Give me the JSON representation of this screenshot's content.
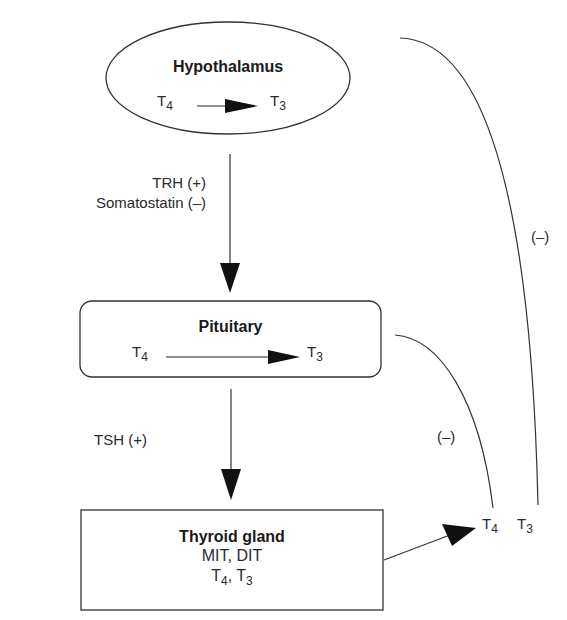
{
  "diagram": {
    "type": "flowchart",
    "nodes": {
      "hypothalamus": {
        "title": "Hypothalamus",
        "from": "T",
        "from_sub": "4",
        "to": "T",
        "to_sub": "3"
      },
      "pituitary": {
        "title": "Pituitary",
        "from": "T",
        "from_sub": "4",
        "to": "T",
        "to_sub": "3"
      },
      "thyroid": {
        "title": "Thyroid gland",
        "line1": "MIT, DIT",
        "t4": "T",
        "t4_sub": "4",
        "sep": ", ",
        "t3": "T",
        "t3_sub": "3"
      }
    },
    "edge_labels": {
      "trh": "TRH (+)",
      "somatostatin": "Somatostatin (–)",
      "tsh": "TSH (+)",
      "feedback_outer": "(–)",
      "feedback_inner": "(–)"
    },
    "output": {
      "t4": "T",
      "t4_sub": "4",
      "t3": "T",
      "t3_sub": "3"
    },
    "colors": {
      "line": "#333333",
      "text": "#2a2a2a"
    }
  }
}
